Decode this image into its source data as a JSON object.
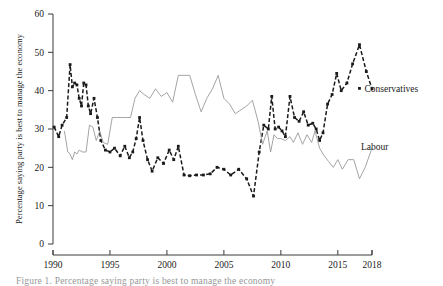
{
  "chart_data": {
    "type": "line",
    "title": "",
    "xlabel": "",
    "ylabel": "Percentage saying party is best to manage the economy",
    "xlim": [
      1990,
      2018
    ],
    "ylim": [
      0,
      60
    ],
    "grid": false,
    "legend_position": "inline-right-end-labels",
    "y_ticks": [
      "0",
      "10",
      "20",
      "30",
      "40",
      "50",
      "60"
    ],
    "y_tick_values": [
      0,
      10,
      20,
      30,
      40,
      50,
      60
    ],
    "x_ticks": [
      "1990",
      "1995",
      "2000",
      "2005",
      "2010",
      "2015",
      "2018"
    ],
    "x_tick_values": [
      1990,
      1995,
      2000,
      2005,
      2010,
      2015,
      2018
    ],
    "series": [
      {
        "name": "Conservatives",
        "color": "#1a1a1a",
        "style": "dashed-with-markers",
        "label_x": 2016.9,
        "label_y": 40.6,
        "points": [
          [
            1990.1,
            30.5
          ],
          [
            1990.5,
            28.0
          ],
          [
            1990.8,
            31.0
          ],
          [
            1991.2,
            33.0
          ],
          [
            1991.5,
            46.8
          ],
          [
            1991.7,
            41.0
          ],
          [
            1991.9,
            42.0
          ],
          [
            1992.1,
            41.5
          ],
          [
            1992.3,
            38.0
          ],
          [
            1992.5,
            36.0
          ],
          [
            1992.7,
            42.0
          ],
          [
            1992.9,
            41.5
          ],
          [
            1993.1,
            36.0
          ],
          [
            1993.3,
            34.0
          ],
          [
            1993.6,
            38.0
          ],
          [
            1993.9,
            33.0
          ],
          [
            1994.2,
            27.0
          ],
          [
            1994.6,
            24.5
          ],
          [
            1995.0,
            24.0
          ],
          [
            1995.4,
            25.0
          ],
          [
            1995.9,
            23.0
          ],
          [
            1996.3,
            25.5
          ],
          [
            1996.7,
            22.5
          ],
          [
            1997.0,
            24.0
          ],
          [
            1997.3,
            27.5
          ],
          [
            1997.6,
            33.0
          ],
          [
            1997.9,
            27.0
          ],
          [
            1998.3,
            22.0
          ],
          [
            1998.7,
            19.0
          ],
          [
            1999.2,
            22.5
          ],
          [
            1999.7,
            21.0
          ],
          [
            2000.2,
            24.5
          ],
          [
            2000.6,
            22.0
          ],
          [
            2001.0,
            25.5
          ],
          [
            2001.5,
            18.0
          ],
          [
            2002.0,
            17.8
          ],
          [
            2002.6,
            18.0
          ],
          [
            2003.2,
            18.0
          ],
          [
            2003.8,
            18.3
          ],
          [
            2004.4,
            20.0
          ],
          [
            2005.0,
            19.5
          ],
          [
            2005.6,
            18.0
          ],
          [
            2006.3,
            19.5
          ],
          [
            2007.0,
            17.0
          ],
          [
            2007.6,
            12.5
          ],
          [
            2008.1,
            24.0
          ],
          [
            2008.5,
            31.0
          ],
          [
            2008.9,
            30.0
          ],
          [
            2009.2,
            38.5
          ],
          [
            2009.5,
            30.0
          ],
          [
            2009.8,
            30.5
          ],
          [
            2010.1,
            29.5
          ],
          [
            2010.4,
            28.0
          ],
          [
            2010.8,
            38.5
          ],
          [
            2011.2,
            33.0
          ],
          [
            2011.6,
            32.0
          ],
          [
            2012.0,
            34.5
          ],
          [
            2012.4,
            31.0
          ],
          [
            2012.8,
            31.5
          ],
          [
            2013.1,
            30.0
          ],
          [
            2013.4,
            27.0
          ],
          [
            2013.7,
            29.0
          ],
          [
            2014.1,
            36.5
          ],
          [
            2014.5,
            39.0
          ],
          [
            2014.9,
            44.5
          ],
          [
            2015.3,
            40.0
          ],
          [
            2015.8,
            42.0
          ],
          [
            2016.3,
            47.0
          ],
          [
            2016.9,
            52.0
          ],
          [
            2017.5,
            45.0
          ],
          [
            2018.0,
            40.5
          ]
        ]
      },
      {
        "name": "Labour",
        "color": "#9a9a9a",
        "style": "solid-thin",
        "label_x": 2016.6,
        "label_y": 25.5,
        "points": [
          [
            1991.0,
            29.5
          ],
          [
            1991.3,
            24.0
          ],
          [
            1991.5,
            23.5
          ],
          [
            1991.7,
            22.0
          ],
          [
            1991.9,
            24.0
          ],
          [
            1992.1,
            23.5
          ],
          [
            1992.3,
            24.5
          ],
          [
            1992.6,
            24.0
          ],
          [
            1992.9,
            24.0
          ],
          [
            1993.2,
            31.0
          ],
          [
            1993.5,
            30.5
          ],
          [
            1993.8,
            27.0
          ],
          [
            1994.1,
            29.5
          ],
          [
            1994.4,
            26.5
          ],
          [
            1994.8,
            26.0
          ],
          [
            1995.2,
            33.0
          ],
          [
            1995.6,
            33.0
          ],
          [
            1996.0,
            33.0
          ],
          [
            1996.4,
            33.0
          ],
          [
            1996.8,
            33.0
          ],
          [
            1997.2,
            38.0
          ],
          [
            1997.6,
            40.0
          ],
          [
            1998.0,
            39.0
          ],
          [
            1998.5,
            38.0
          ],
          [
            1999.0,
            40.5
          ],
          [
            1999.5,
            38.5
          ],
          [
            2000.0,
            39.5
          ],
          [
            2000.5,
            37.0
          ],
          [
            2001.0,
            44.0
          ],
          [
            2001.5,
            44.0
          ],
          [
            2002.0,
            44.0
          ],
          [
            2002.5,
            39.0
          ],
          [
            2003.0,
            34.5
          ],
          [
            2003.5,
            38.0
          ],
          [
            2004.0,
            40.5
          ],
          [
            2004.5,
            44.0
          ],
          [
            2005.0,
            38.0
          ],
          [
            2005.5,
            36.5
          ],
          [
            2006.0,
            34.0
          ],
          [
            2006.5,
            35.0
          ],
          [
            2007.0,
            36.0
          ],
          [
            2007.5,
            37.5
          ],
          [
            2008.0,
            32.0
          ],
          [
            2008.4,
            26.0
          ],
          [
            2008.8,
            29.5
          ],
          [
            2009.1,
            24.0
          ],
          [
            2009.4,
            28.5
          ],
          [
            2009.7,
            27.5
          ],
          [
            2010.0,
            27.5
          ],
          [
            2010.4,
            27.0
          ],
          [
            2010.8,
            28.0
          ],
          [
            2011.1,
            26.5
          ],
          [
            2011.5,
            29.0
          ],
          [
            2011.9,
            26.0
          ],
          [
            2012.3,
            28.5
          ],
          [
            2012.7,
            26.5
          ],
          [
            2013.0,
            29.5
          ],
          [
            2013.4,
            25.0
          ],
          [
            2013.8,
            23.0
          ],
          [
            2014.2,
            21.5
          ],
          [
            2014.6,
            20.0
          ],
          [
            2015.0,
            22.0
          ],
          [
            2015.4,
            19.5
          ],
          [
            2015.9,
            22.0
          ],
          [
            2016.4,
            22.0
          ],
          [
            2016.9,
            17.0
          ],
          [
            2017.4,
            20.0
          ],
          [
            2018.0,
            25.0
          ]
        ]
      }
    ],
    "annotations": [
      {
        "text": "Conservatives",
        "x": 2016.9,
        "y": 40.6
      },
      {
        "text": "Labour",
        "x": 2016.6,
        "y": 25.5
      }
    ]
  },
  "caption": {
    "text": "Figure 1. Percentage saying party is best to manage the economy"
  }
}
